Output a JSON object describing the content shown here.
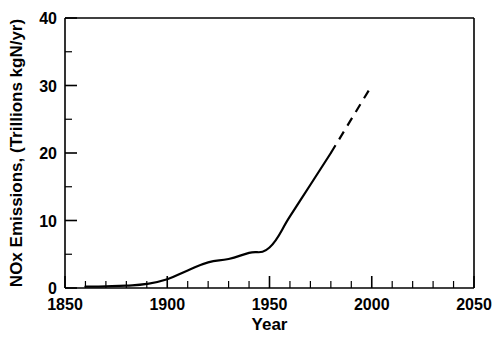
{
  "chart_data": {
    "type": "line",
    "title": "",
    "xlabel": "Year",
    "ylabel": "NOx Emissions, (Trillions kgN/yr)",
    "xlim": [
      1850,
      2050
    ],
    "ylim": [
      0,
      40
    ],
    "grid": false,
    "legend": "none",
    "x_major_ticks": [
      1850,
      1900,
      1950,
      2000,
      2050
    ],
    "x_tick_labels": [
      "1850",
      "1900",
      "1950",
      "2000",
      "2050"
    ],
    "x_minor_interval": 10,
    "y_major_ticks": [
      0,
      10,
      20,
      30,
      40
    ],
    "y_tick_labels": [
      "0",
      "10",
      "20",
      "30",
      "40"
    ],
    "y_minor_interval": 5,
    "line_color": "#000000",
    "frame_color": "#000000",
    "background_color": "#ffffff",
    "series": [
      {
        "name": "Historical NOx emissions",
        "style": "solid",
        "x": [
          1860,
          1870,
          1880,
          1890,
          1900,
          1910,
          1920,
          1930,
          1940,
          1950,
          1960,
          1970,
          1980
        ],
        "values": [
          0.2,
          0.25,
          0.35,
          0.6,
          1.3,
          2.6,
          3.8,
          4.3,
          5.2,
          6.0,
          10.6,
          15.3,
          20.0
        ]
      },
      {
        "name": "Projected NOx emissions",
        "style": "dashed",
        "x": [
          1980,
          2000
        ],
        "values": [
          20.0,
          30.0
        ]
      }
    ]
  },
  "axis_labels": {
    "x_title": "Year",
    "y_title": "NOx Emissions, (Trillions kgN/yr)"
  }
}
